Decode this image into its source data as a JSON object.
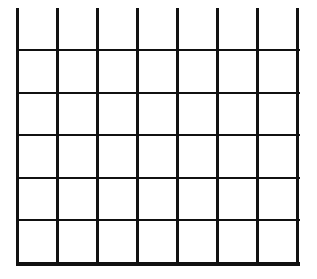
{
  "grid": {
    "line_color": "#111111",
    "background": "#ffffff",
    "columns": 7,
    "rows": 5,
    "vertical_lines_x": [
      17,
      57,
      97,
      137,
      177,
      217,
      257,
      297
    ],
    "vertical_top": 8,
    "vertical_bottom": 265,
    "horizontal_lines_y": [
      50,
      93,
      135,
      178,
      220
    ],
    "bottom_line_y": 262,
    "left": 17,
    "right": 300
  }
}
